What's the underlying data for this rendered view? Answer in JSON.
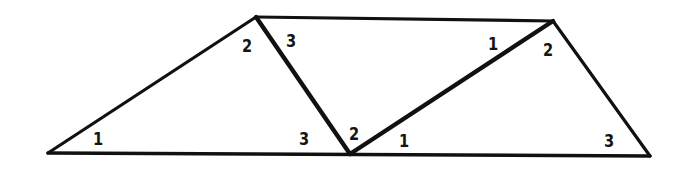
{
  "figure": {
    "background_color": "#ffffff",
    "stroke_color": "#111111",
    "width": 680,
    "height": 171,
    "vertices": {
      "bottom_left": [
        48,
        153
      ],
      "top_left": [
        256,
        17
      ],
      "top_right": [
        553,
        21
      ],
      "bottom_right": [
        650,
        156
      ],
      "bottom_middle": [
        350,
        154
      ]
    },
    "edges": [
      {
        "name": "bottom-base",
        "from": "bottom_left",
        "to": "bottom_right",
        "weight": "medium"
      },
      {
        "name": "left-slant",
        "from": "bottom_left",
        "to": "top_left",
        "weight": "thin"
      },
      {
        "name": "top-edge",
        "from": "top_left",
        "to": "top_right",
        "weight": "thin"
      },
      {
        "name": "right-slant",
        "from": "top_right",
        "to": "bottom_right",
        "weight": "thin"
      },
      {
        "name": "left-diagonal",
        "from": "top_left",
        "to": "bottom_middle",
        "weight": "thick"
      },
      {
        "name": "right-diagonal",
        "from": "bottom_middle",
        "to": "top_right",
        "weight": "thick"
      }
    ],
    "labels": [
      {
        "id": "left-triangle-angle-1",
        "text": "1",
        "x": 98,
        "y": 139
      },
      {
        "id": "left-triangle-angle-2",
        "text": "2",
        "x": 247,
        "y": 46
      },
      {
        "id": "middle-triangle-angle-3-top",
        "text": "3",
        "x": 291,
        "y": 41
      },
      {
        "id": "middle-triangle-angle-3-bottom",
        "text": "3",
        "x": 304,
        "y": 139
      },
      {
        "id": "middle-triangle-angle-2",
        "text": "2",
        "x": 354,
        "y": 134
      },
      {
        "id": "right-triangle-angle-1-bottom",
        "text": "1",
        "x": 404,
        "y": 141
      },
      {
        "id": "right-triangle-angle-1-top",
        "text": "1",
        "x": 493,
        "y": 44
      },
      {
        "id": "right-triangle-angle-2",
        "text": "2",
        "x": 548,
        "y": 50
      },
      {
        "id": "right-triangle-angle-3",
        "text": "3",
        "x": 609,
        "y": 141
      }
    ]
  }
}
